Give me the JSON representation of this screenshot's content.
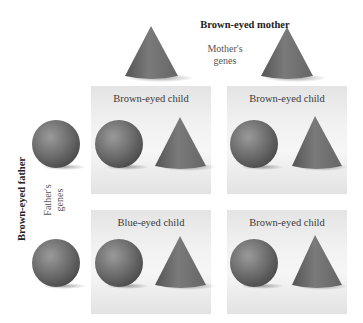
{
  "mother": {
    "title": "Brown-eyed mother",
    "genes_label": "Mother's\ngenes",
    "genes_line1": "Mother's",
    "genes_line2": "genes",
    "alleles": [
      "cone",
      "cone"
    ]
  },
  "father": {
    "title": "Brown-eyed father",
    "genes_line1": "Father's",
    "genes_line2": "genes",
    "alleles": [
      "sphere",
      "sphere"
    ]
  },
  "children": [
    {
      "label": "Brown-eyed child",
      "alleles": [
        "sphere",
        "cone"
      ]
    },
    {
      "label": "Brown-eyed child",
      "alleles": [
        "sphere",
        "cone"
      ]
    },
    {
      "label": "Blue-eyed child",
      "alleles": [
        "sphere",
        "cone"
      ]
    },
    {
      "label": "Brown-eyed child",
      "alleles": [
        "sphere",
        "cone"
      ]
    }
  ],
  "colors": {
    "shape": "#6e6e6e",
    "panel": "#efefef",
    "title_text": "#222222",
    "label_text": "#3a3a3a"
  }
}
